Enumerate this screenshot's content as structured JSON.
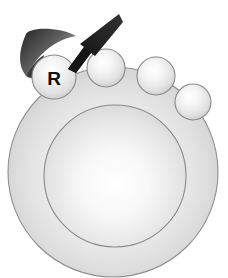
{
  "figure": {
    "kind": "schematic-diagram",
    "background_color": "#ffffff",
    "width": 228,
    "height": 278
  },
  "palette": {
    "background": "#ffffff",
    "body_fill_light": "#ffffff",
    "body_fill_mid": "#d8d8d8",
    "body_fill_edge": "#c2c2c2",
    "body_stroke": "#8f8f8f",
    "inner_ring_stroke": "#8a8a8a",
    "sphere_fill_light": "#ffffff",
    "sphere_fill_mid": "#e3e3e3",
    "sphere_fill_edge": "#cfcfcf",
    "sphere_stroke": "#8a8a8a",
    "crescent_dark": "#2b2b2b",
    "crescent_light": "#b5b5b5",
    "arrow_fill": "#1a1a1a",
    "label_color": "#111111"
  },
  "body": {
    "name": "large-sphere",
    "center_x": 113,
    "center_y": 172,
    "radius": 105,
    "inner_ring": {
      "name": "inner-circle",
      "center_x": 115,
      "center_y": 176,
      "radius": 71
    }
  },
  "small_spheres": [
    {
      "id": "sphere-r",
      "label": "R",
      "has_label": true,
      "center_x": 54,
      "center_y": 77,
      "radius": 22
    },
    {
      "id": "sphere-2",
      "label": "",
      "has_label": false,
      "center_x": 106,
      "center_y": 68,
      "radius": 19
    },
    {
      "id": "sphere-3",
      "label": "",
      "has_label": false,
      "center_x": 156,
      "center_y": 76,
      "radius": 19
    },
    {
      "id": "sphere-4",
      "label": "",
      "has_label": false,
      "center_x": 193,
      "center_y": 102,
      "radius": 18
    }
  ],
  "crescent": {
    "name": "dark-crescent-wedge",
    "description": "dark tapered crescent behind the labeled R sphere"
  },
  "arrow": {
    "name": "pointer-arrow",
    "description": "black tapered arrow pointing down-left at the R sphere",
    "tip_x": 68,
    "tip_y": 69,
    "tail_x": 119,
    "tail_y": 14,
    "direction": "down-left"
  }
}
